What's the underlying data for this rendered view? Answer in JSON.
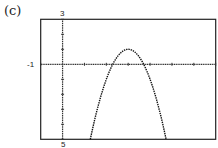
{
  "panel_label": "(c)",
  "window": {
    "xmin_label": "-1",
    "ymax_label": "3",
    "ymin_label": "5"
  },
  "chart_data": {
    "type": "line",
    "title": "",
    "xlabel": "",
    "ylabel": "",
    "xlim": [
      -1,
      7
    ],
    "ylim": [
      -5,
      3
    ],
    "xscale": 1,
    "yscale": 1,
    "grid": false,
    "function": "y = -2(x - 3)^2 + 1",
    "vertex": [
      3,
      1
    ],
    "x_intercepts": [
      2.29,
      3.71
    ],
    "series": [
      {
        "name": "parabola",
        "x": [
          1.27,
          1.5,
          2.0,
          2.29,
          2.5,
          3.0,
          3.5,
          3.71,
          4.0,
          4.5,
          4.73
        ],
        "y": [
          -5,
          -3.5,
          -1,
          0,
          0.5,
          1,
          0.5,
          0,
          -1,
          -3.5,
          -5
        ]
      }
    ],
    "tick_labels": {
      "top": "3",
      "left": "-1",
      "bottom": "5"
    }
  }
}
